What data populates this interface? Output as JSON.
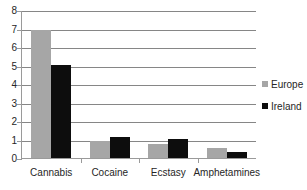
{
  "chart_data": {
    "type": "bar",
    "title": "",
    "subtitle": "",
    "xlabel": "",
    "ylabel": "",
    "categories": [
      "Cannabis",
      "Cocaine",
      "Ecstasy",
      "Amphetamines"
    ],
    "series": [
      {
        "name": "Europe",
        "color": "#a6a6a6",
        "values": [
          7.0,
          1.0,
          0.8,
          0.6
        ]
      },
      {
        "name": "Ireland",
        "color": "#0d0d0d",
        "values": [
          5.1,
          1.2,
          1.1,
          0.4
        ]
      }
    ],
    "ylim": [
      0,
      8
    ],
    "yticks": [
      "0",
      "1",
      "2",
      "3",
      "4",
      "5",
      "6",
      "7",
      "8"
    ],
    "grid": "horizontal",
    "legend_position": "right"
  },
  "legend": {
    "entries": [
      {
        "label": "Europe",
        "swatch": "legend-swatch-europe"
      },
      {
        "label": "Ireland",
        "swatch": "legend-swatch-ireland"
      }
    ]
  }
}
